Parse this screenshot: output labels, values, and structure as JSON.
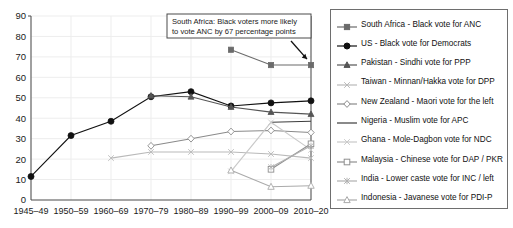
{
  "chart_data": {
    "type": "line",
    "title": "",
    "subtitle": "",
    "xlabel": "",
    "ylabel": "",
    "ylim": [
      0,
      90
    ],
    "ytick_step": 10,
    "yticks": [
      "0",
      "10",
      "20",
      "30",
      "40",
      "50",
      "60",
      "70",
      "80",
      "90"
    ],
    "grid": true,
    "legend_position": "right",
    "categories": [
      "1945–49",
      "1950–59",
      "1960–69",
      "1970–79",
      "1980–89",
      "1990–99",
      "2000–09",
      "2010–20"
    ],
    "annotations": [
      {
        "name": "south-africa-callout",
        "line1": "South Africa: Black voters more likely",
        "line2": "to vote ANC by 67 percentage points",
        "points_to": "2010–20 South Africa point"
      }
    ],
    "series": [
      {
        "name": "South Africa - Black vote for ANC",
        "marker": "filled-square",
        "color": "#6b6b6b",
        "values": [
          null,
          null,
          null,
          null,
          null,
          73.5,
          66,
          66
        ]
      },
      {
        "name": "US - Black vote for Democrats",
        "marker": "filled-circle",
        "color": "#111111",
        "values": [
          11.5,
          31.5,
          38.5,
          50.5,
          53,
          46,
          47.5,
          48.5
        ]
      },
      {
        "name": "Pakistan - Sindhi vote for PPP",
        "marker": "filled-triangle",
        "color": "#555555",
        "values": [
          null,
          null,
          null,
          51,
          50.5,
          45.5,
          43,
          42
        ]
      },
      {
        "name": "Taiwan - Minnan/Hakka vote for DPP",
        "marker": "open-x-light",
        "color": "#b9b9b9",
        "values": [
          null,
          null,
          20.5,
          23.5,
          23.5,
          23.5,
          22.5,
          20.5
        ]
      },
      {
        "name": "New Zealand - Maori vote for the left",
        "marker": "open-diamond",
        "color": "#8a8a8a",
        "values": [
          null,
          null,
          null,
          26.5,
          30,
          33.5,
          34,
          33
        ]
      },
      {
        "name": "Nigeria - Muslim vote for APC",
        "marker": "plain-line",
        "color": "#3c3c3c",
        "values": [
          null,
          null,
          null,
          null,
          null,
          null,
          38,
          38.5
        ]
      },
      {
        "name": "Ghana - Mole-Dagbon vote for NDC",
        "marker": "open-x-lighter",
        "color": "#c9c9c9",
        "values": [
          null,
          null,
          null,
          null,
          null,
          14,
          38,
          24.5
        ]
      },
      {
        "name": "Malaysia - Chinese vote for DAP / PKR",
        "marker": "open-square",
        "color": "#8f8f8f",
        "values": [
          null,
          null,
          null,
          null,
          null,
          null,
          15,
          27.5
        ]
      },
      {
        "name": "India - Lower caste vote for INC / left",
        "marker": "open-star-light",
        "color": "#b0b0b0",
        "values": [
          null,
          null,
          null,
          null,
          null,
          null,
          16,
          26.5
        ]
      },
      {
        "name": "Indonesia - Javanese vote for PDI-P",
        "marker": "open-triangle",
        "color": "#aaaaaa",
        "values": [
          null,
          null,
          null,
          null,
          null,
          14.5,
          6.5,
          7
        ]
      }
    ]
  },
  "legend": {
    "items": [
      {
        "label": "South Africa - Black vote for ANC"
      },
      {
        "label": "US - Black vote for Democrats"
      },
      {
        "label": "Pakistan - Sindhi vote for PPP"
      },
      {
        "label": "Taiwan - Minnan/Hakka vote for DPP"
      },
      {
        "label": "New Zealand - Maori vote for the left"
      },
      {
        "label": "Nigeria - Muslim vote for APC"
      },
      {
        "label": "Ghana - Mole-Dagbon vote for NDC"
      },
      {
        "label": "Malaysia - Chinese vote for DAP / PKR"
      },
      {
        "label": "India - Lower caste vote for INC / left"
      },
      {
        "label": "Indonesia - Javanese vote for PDI-P"
      }
    ]
  }
}
